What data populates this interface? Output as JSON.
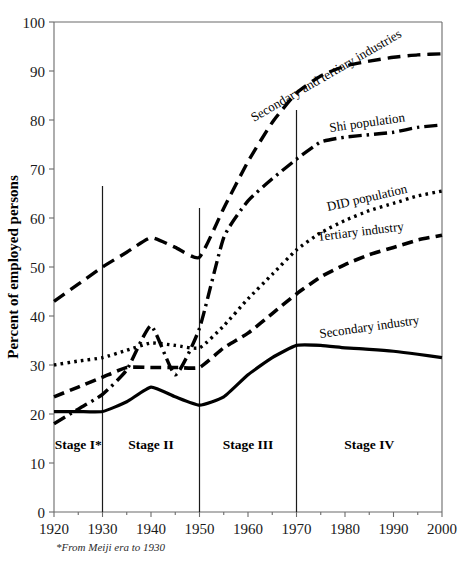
{
  "figure": {
    "background": "#ffffff",
    "ink": "#000000",
    "axis_color": "#6b6b6b"
  },
  "axes": {
    "ylabel": "Percent of employed persons",
    "xlabel": "",
    "y_ticks": [
      "0",
      "10",
      "20",
      "30",
      "40",
      "50",
      "60",
      "70",
      "80",
      "90",
      "100"
    ],
    "x_ticks": [
      "1920",
      "1930",
      "1940",
      "1950",
      "1960",
      "1970",
      "1980",
      "1990",
      "2000"
    ]
  },
  "stages": [
    {
      "name": "stage-1",
      "label": "Stage I*",
      "start": 1920,
      "end": 1930
    },
    {
      "name": "stage-2",
      "label": "Stage II",
      "start": 1930,
      "end": 1950
    },
    {
      "name": "stage-3",
      "label": "Stage III",
      "start": 1950,
      "end": 1970
    },
    {
      "name": "stage-4",
      "label": "Stage IV",
      "start": 1970,
      "end": 2000
    }
  ],
  "stage_dividers": [
    1930,
    1950,
    1970
  ],
  "footnote": "*From Meiji era to 1930",
  "series_labels": {
    "secondary_tertiary": "Secondary and tertiary industries",
    "shi_population": "Shi population",
    "did_population": "DID population",
    "tertiary_industry": "Tertiary industry",
    "secondary_industry": "Secondary industry"
  },
  "chart_data": {
    "type": "line",
    "title": "",
    "xlabel": "",
    "ylabel": "Percent of employed persons",
    "xlim": [
      1920,
      2000
    ],
    "ylim": [
      0,
      100
    ],
    "grid": false,
    "legend": "inline-labels-on-curves",
    "x": [
      1920,
      1925,
      1930,
      1935,
      1940,
      1945,
      1950,
      1955,
      1960,
      1965,
      1970,
      1975,
      1980,
      1985,
      1990,
      1995,
      2000
    ],
    "series": [
      {
        "name": "Secondary and tertiary industries",
        "dash": "long-dash",
        "values": [
          43,
          46.5,
          50,
          53,
          56,
          54,
          52,
          62,
          71.5,
          79.5,
          85.5,
          89,
          91,
          92,
          92.8,
          93.3,
          93.5
        ]
      },
      {
        "name": "Shi population",
        "dash": "dash-dot",
        "values": [
          18,
          21,
          24,
          29,
          38,
          28,
          37.5,
          56,
          63.5,
          68,
          72,
          75.5,
          76.5,
          77,
          77.5,
          78.5,
          79
        ]
      },
      {
        "name": "DID population",
        "dash": "dotted",
        "values": [
          30,
          30.8,
          31.5,
          33,
          34.5,
          34,
          33.5,
          38,
          43.5,
          48.5,
          53.5,
          57,
          59.5,
          61.5,
          63,
          64.5,
          65.5
        ]
      },
      {
        "name": "Tertiary industry",
        "dash": "medium-dash",
        "values": [
          23.5,
          25.5,
          27.5,
          29.5,
          29.5,
          29.5,
          29.5,
          33.5,
          36.5,
          40.5,
          44.5,
          48,
          50.5,
          52.5,
          54,
          55.5,
          56.5
        ]
      },
      {
        "name": "Secondary industry",
        "dash": "solid",
        "values": [
          20.5,
          20.5,
          20.5,
          22.5,
          25.5,
          23.5,
          21.8,
          23.5,
          28,
          31.5,
          34,
          34,
          33.5,
          33.2,
          32.8,
          32.2,
          31.5
        ]
      }
    ]
  }
}
